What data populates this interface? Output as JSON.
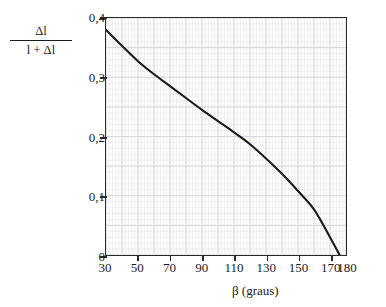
{
  "figure": {
    "background_color": "#ffffff",
    "frame_color": "#2b2b2b",
    "curve_color": "#1a1a1a",
    "grid_minor_color": "#e8e8ee",
    "grid_major_color": "#d2d2dc"
  },
  "axes": {
    "y_caption": {
      "numerator": "Δl",
      "denominator": "l + Δl"
    },
    "x_caption": "β (graus)",
    "y_ticklabels": [
      "0,4",
      "0,3",
      "0,2",
      "0,1",
      "0"
    ],
    "y_tickvalues": [
      0.4,
      0.3,
      0.2,
      0.1,
      0
    ],
    "x_ticklabels": [
      "30",
      "50",
      "70",
      "90",
      "110",
      "130",
      "150",
      "170",
      "180"
    ],
    "x_tickvalues": [
      30,
      50,
      70,
      90,
      110,
      130,
      150,
      170,
      180
    ]
  },
  "chart_data": {
    "type": "line",
    "title": "",
    "subtitle": "",
    "xlabel": "β (graus)",
    "ylabel": "Δl / (l + Δl)",
    "xlim": [
      30,
      180
    ],
    "ylim": [
      0,
      0.4
    ],
    "grid": true,
    "grid_minor_step_x": 2,
    "grid_minor_step_y": 0.01,
    "grid_major_step_x": 10,
    "grid_major_step_y": 0.05,
    "legend": null,
    "legend_position": "none",
    "annotations": [],
    "series": [
      {
        "name": "Δl/(l+Δl)",
        "color": "#1a1a1a",
        "linewidth": 2.1,
        "x": [
          30,
          40,
          50,
          60,
          70,
          80,
          90,
          100,
          110,
          120,
          130,
          140,
          150,
          160,
          170,
          176
        ],
        "y": [
          0.38,
          0.353,
          0.327,
          0.305,
          0.285,
          0.265,
          0.245,
          0.226,
          0.207,
          0.187,
          0.163,
          0.137,
          0.108,
          0.077,
          0.03,
          0.0
        ]
      }
    ]
  }
}
